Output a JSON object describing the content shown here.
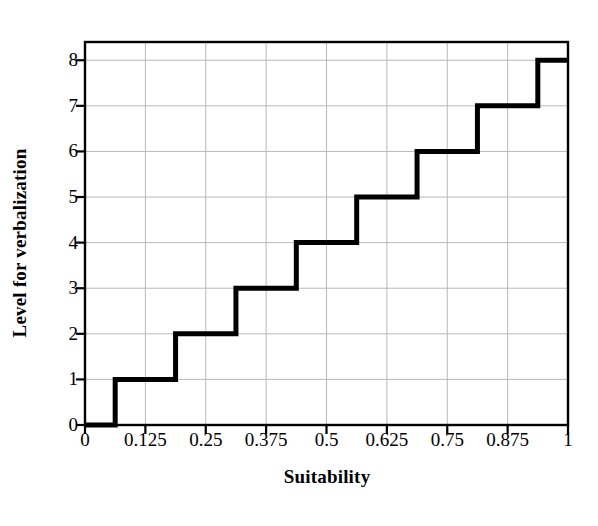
{
  "chart_data": {
    "type": "line",
    "subtype": "step",
    "title": "",
    "xlabel": "Suitability",
    "ylabel": "Level for verbalization",
    "xlim": [
      0,
      1
    ],
    "ylim": [
      0,
      8.4
    ],
    "grid": true,
    "legend": false,
    "xticks": [
      0,
      0.125,
      0.25,
      0.375,
      0.5,
      0.625,
      0.75,
      0.875,
      1
    ],
    "xtick_labels": [
      "0",
      "0.125",
      "0.25",
      "0.375",
      "0.5",
      "0.625",
      "0.75",
      "0.875",
      "1"
    ],
    "yticks": [
      0,
      1,
      2,
      3,
      4,
      5,
      6,
      7,
      8
    ],
    "ytick_labels": [
      "0",
      "1",
      "2",
      "3",
      "4",
      "5",
      "6",
      "7",
      "8"
    ],
    "series": [
      {
        "name": "Level for verbalization",
        "color": "#000000",
        "line_width": 5,
        "step_type": "post",
        "x": [
          0,
          0.0625,
          0.1875,
          0.3125,
          0.4375,
          0.5625,
          0.6875,
          0.8125,
          0.9375,
          1
        ],
        "y": [
          0,
          1,
          2,
          3,
          4,
          5,
          6,
          7,
          8,
          8
        ],
        "points": [
          {
            "x": 0,
            "y": 0
          },
          {
            "x": 0.0625,
            "y": 1
          },
          {
            "x": 0.1875,
            "y": 2
          },
          {
            "x": 0.3125,
            "y": 3
          },
          {
            "x": 0.4375,
            "y": 4
          },
          {
            "x": 0.5625,
            "y": 5
          },
          {
            "x": 0.6875,
            "y": 6
          },
          {
            "x": 0.8125,
            "y": 7
          },
          {
            "x": 0.9375,
            "y": 8
          },
          {
            "x": 1,
            "y": 8
          }
        ]
      }
    ],
    "colors": {
      "line": "#000000",
      "grid": "#b8b8b8",
      "axis": "#000000",
      "background": "#ffffff",
      "text": "#000000"
    }
  }
}
